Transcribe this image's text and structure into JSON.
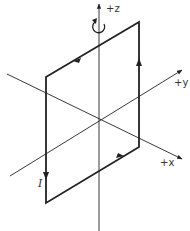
{
  "diagram": {
    "type": "current-loop-3d-axes",
    "axes": {
      "z_label": "+z",
      "y_label": "+y",
      "x_label": "+x"
    },
    "loop": {
      "current_label": "I",
      "direction": "counterclockwise-around-z-viewed-from-above"
    },
    "rotation_indicator": "counterclockwise-rotation-about-z",
    "colors": {
      "line": "#222222",
      "background": "#ffffff"
    }
  }
}
